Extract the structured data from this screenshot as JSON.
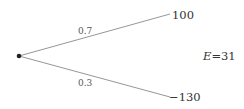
{
  "diagram": {
    "type": "probability-tree",
    "root": {
      "name": "chance-node"
    },
    "branches": [
      {
        "probability": "0.7",
        "outcome": "100"
      },
      {
        "probability": "0.3",
        "outcome": "−130"
      }
    ],
    "expected_value": {
      "symbol": "E",
      "equals": "=",
      "value": "31"
    },
    "colors": {
      "line": "#8a8a8a",
      "node": "#222222",
      "text": "#333333"
    }
  }
}
